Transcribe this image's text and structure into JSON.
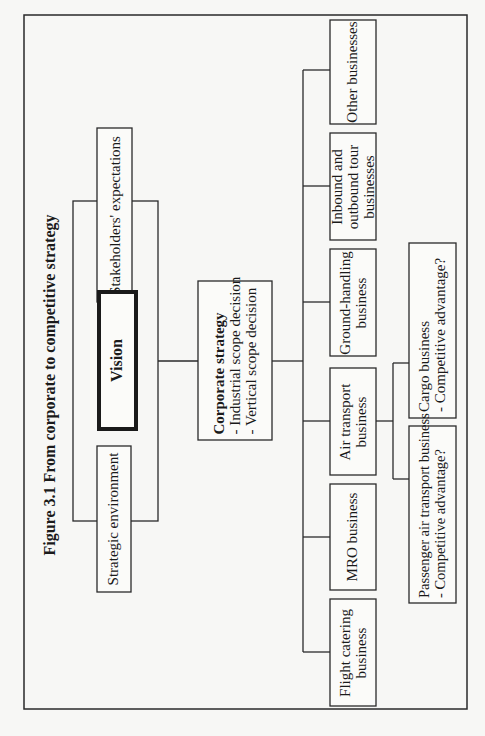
{
  "figure": {
    "title": "Figure 3.1 From corporate to competitive strategy",
    "orientation": "rotated 90 degrees counter-clockwise",
    "inputs": {
      "stakeholders": "Stakeholders' expectations",
      "vision": "Vision",
      "strategic_environment": "Strategic environment"
    },
    "corporate": {
      "title": "Corporate strategy",
      "items": [
        "- Industrial scope decision",
        "- Vertical scope decision"
      ]
    },
    "businesses": [
      {
        "lines": [
          "Other businesses"
        ]
      },
      {
        "lines": [
          "Inbound and",
          "outbound tour",
          "businesses"
        ]
      },
      {
        "lines": [
          "Ground-handling",
          "business"
        ]
      },
      {
        "lines": [
          "Air transport",
          "business"
        ]
      },
      {
        "lines": [
          "MRO business"
        ]
      },
      {
        "lines": [
          "Flight catering",
          "business"
        ]
      }
    ],
    "sub_businesses": [
      {
        "lines": [
          "Cargo business",
          "- Competitive advantage?"
        ]
      },
      {
        "lines": [
          "Passenger air transport business",
          "- Competitive advantage?"
        ]
      }
    ]
  }
}
